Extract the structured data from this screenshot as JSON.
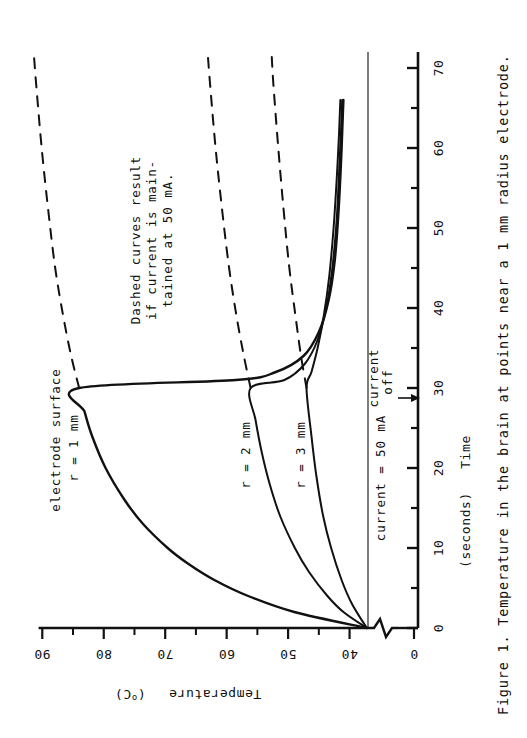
{
  "figure": {
    "caption": "Figure 1.  Temperature in the brain at points near a 1 mm radius electrode.",
    "caption_number": "Figure 1.",
    "caption_text": "Temperature in the brain at points near a 1 mm radius electrode.",
    "orientation": "rotated-90-clockwise"
  },
  "annotations": {
    "note_line1": "Dashed curves result",
    "note_line2": "if current is main-",
    "note_line3": "tained at 50 mA.",
    "current_label": "current = 50 mA",
    "current_off_line1": "current",
    "current_off_line2": "off",
    "curve1_line1": "electrode surface",
    "curve1_line2": "r = 1 mm",
    "curve2_label": "r = 2 mm",
    "curve3_label": "r = 3 mm"
  },
  "chart_data": {
    "type": "line",
    "title": "Temperature in the brain at points near a 1 mm radius electrode.",
    "xlabel": "Time  (seconds)",
    "ylabel": "Temperature  (°C)",
    "xlabel_main": "Time",
    "xlabel_unit": "(seconds)",
    "ylabel_main": "Temperature",
    "ylabel_unit": "(°C)",
    "xlim": [
      0,
      72
    ],
    "ylim": [
      37,
      92
    ],
    "y_axis_break": true,
    "y_axis_break_from": 0,
    "y_axis_break_to": 37,
    "baseline_temperature": 37,
    "current_off_time": 30,
    "current_mA": 50,
    "grid": false,
    "legend": "inline-labels",
    "xticks": [
      0,
      10,
      20,
      30,
      40,
      50,
      60,
      70
    ],
    "xticklabels": [
      "0",
      "10",
      "20",
      "30",
      "40",
      "50",
      "60",
      "70"
    ],
    "xminorticks": [
      5,
      15,
      25,
      35,
      45,
      55,
      65
    ],
    "yticks": [
      40,
      50,
      60,
      70,
      80,
      90
    ],
    "yticklabels": [
      "40",
      "50",
      "60",
      "70",
      "80",
      "90"
    ],
    "yminorticks": [
      45,
      55,
      65,
      75,
      85
    ],
    "y_origin_tick": 0,
    "y_origin_ticklabel": "0",
    "series": [
      {
        "name": "electrode surface r = 1 mm",
        "radius_mm": 1,
        "style": "solid",
        "x": [
          0,
          2,
          4,
          6,
          8,
          10,
          13,
          16,
          20,
          24,
          27,
          30,
          31,
          32,
          34,
          37,
          41,
          46,
          52,
          58,
          64,
          66
        ],
        "y": [
          37.2,
          49.0,
          56.5,
          62.0,
          66.2,
          69.6,
          73.6,
          76.6,
          79.7,
          81.9,
          83.1,
          84.0,
          58.5,
          52.0,
          47.5,
          45.0,
          43.4,
          42.4,
          41.8,
          41.4,
          41.1,
          41.0
        ]
      },
      {
        "name": "electrode surface r = 1 mm (dashed, current maintained)",
        "radius_mm": 1,
        "style": "dashed",
        "x": [
          30,
          34,
          39,
          45,
          52,
          60,
          68,
          72
        ],
        "y": [
          84.0,
          85.3,
          86.6,
          87.9,
          89.0,
          90.1,
          91.0,
          91.4
        ]
      },
      {
        "name": "r = 2 mm",
        "radius_mm": 2,
        "style": "solid",
        "x": [
          0,
          2,
          4,
          7,
          10,
          14,
          18,
          22,
          26,
          30,
          31,
          33,
          36,
          40,
          45,
          51,
          57,
          62,
          66
        ],
        "y": [
          37.2,
          41.0,
          43.6,
          46.6,
          48.9,
          51.3,
          53.0,
          54.3,
          55.3,
          56.1,
          50.6,
          47.3,
          45.2,
          43.8,
          42.8,
          42.1,
          41.7,
          41.4,
          41.2
        ]
      },
      {
        "name": "r = 2 mm (dashed, current maintained)",
        "radius_mm": 2,
        "style": "dashed",
        "x": [
          30,
          34,
          39,
          45,
          52,
          60,
          68,
          72
        ],
        "y": [
          56.1,
          57.2,
          58.4,
          59.6,
          60.7,
          61.8,
          62.7,
          63.1
        ]
      },
      {
        "name": "r = 3 mm",
        "radius_mm": 3,
        "style": "solid",
        "x": [
          0,
          3,
          6,
          10,
          14,
          19,
          24,
          30,
          32,
          35,
          39,
          44,
          50,
          56,
          62,
          66
        ],
        "y": [
          37.2,
          39.6,
          41.3,
          43.0,
          44.3,
          45.4,
          46.2,
          47.0,
          46.2,
          45.2,
          44.2,
          43.3,
          42.6,
          42.1,
          41.7,
          41.5
        ]
      },
      {
        "name": "r = 3 mm (dashed, current maintained)",
        "radius_mm": 3,
        "style": "dashed",
        "x": [
          30,
          34,
          39,
          45,
          52,
          60,
          68,
          72
        ],
        "y": [
          47.0,
          47.9,
          48.8,
          49.8,
          50.7,
          51.6,
          52.4,
          52.7
        ]
      }
    ]
  }
}
